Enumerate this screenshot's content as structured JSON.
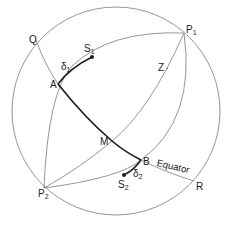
{
  "diagram": {
    "type": "celestial-sphere",
    "colors": {
      "thin_line": "#8a8a8a",
      "thick_line": "#1e1e1e",
      "text": "#222222"
    },
    "labels": {
      "Q": "Q",
      "P1": "P",
      "P1_sub": "1",
      "P2": "P",
      "P2_sub": "2",
      "S1": "S",
      "S1_sub": "1",
      "S2": "S",
      "S2_sub": "2",
      "A": "A",
      "B": "B",
      "M": "M",
      "Z": "Z",
      "R": "R",
      "delta1": "δ",
      "delta1_sub": "1",
      "delta2": "δ",
      "delta2_sub": "2",
      "equator": "Equator"
    }
  }
}
